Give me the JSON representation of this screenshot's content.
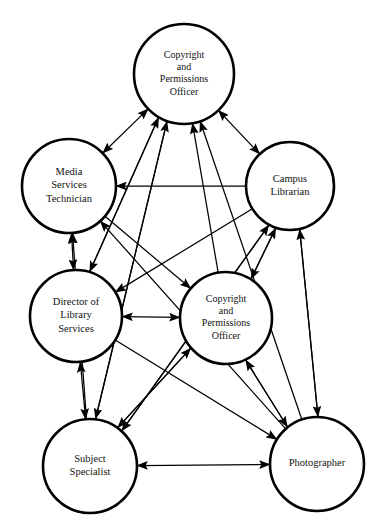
{
  "diagram": {
    "type": "network-sociogram",
    "title": "",
    "background_color": "#ffffff",
    "node_stroke_color": "#000000",
    "edge_color": "#000000",
    "label_color": "#111111",
    "nodes": [
      {
        "id": "copyright_top",
        "label_lines": [
          "Copyright",
          "and",
          "Permissions",
          "Officer"
        ],
        "cx": 184,
        "cy": 74,
        "r": 50
      },
      {
        "id": "media_services",
        "label_lines": [
          "Media",
          "Services",
          "Technician"
        ],
        "cx": 69,
        "cy": 186,
        "r": 47
      },
      {
        "id": "campus_librarian",
        "label_lines": [
          "Campus",
          "Librarian"
        ],
        "cx": 290,
        "cy": 186,
        "r": 44
      },
      {
        "id": "director_library",
        "label_lines": [
          "Director of",
          "Library",
          "Services"
        ],
        "cx": 76,
        "cy": 316,
        "r": 46
      },
      {
        "id": "copyright_center",
        "label_lines": [
          "Copyright",
          "and",
          "Permissions",
          "Officer"
        ],
        "cx": 226,
        "cy": 318,
        "r": 46
      },
      {
        "id": "subject_specialist",
        "label_lines": [
          "Subject",
          "Specialist"
        ],
        "cx": 90,
        "cy": 466,
        "r": 47
      },
      {
        "id": "photographer",
        "label_lines": [
          "Photographer"
        ],
        "cx": 317,
        "cy": 464,
        "r": 47
      }
    ],
    "edges": [
      {
        "from": "media_services",
        "to": "copyright_top",
        "direction": "both"
      },
      {
        "from": "copyright_top",
        "to": "campus_librarian",
        "direction": "both"
      },
      {
        "from": "media_services",
        "to": "director_library",
        "direction": "both"
      },
      {
        "from": "director_library",
        "to": "subject_specialist",
        "direction": "both"
      },
      {
        "from": "subject_specialist",
        "to": "photographer",
        "direction": "both"
      },
      {
        "from": "director_library",
        "to": "copyright_center",
        "direction": "both"
      },
      {
        "from": "campus_librarian",
        "to": "media_services",
        "direction": "forward"
      },
      {
        "from": "campus_librarian",
        "to": "director_library",
        "direction": "forward"
      },
      {
        "from": "campus_librarian",
        "to": "copyright_center",
        "direction": "forward"
      },
      {
        "from": "campus_librarian",
        "to": "subject_specialist",
        "direction": "forward"
      },
      {
        "from": "campus_librarian",
        "to": "photographer",
        "direction": "forward"
      },
      {
        "from": "director_library",
        "to": "copyright_top",
        "direction": "forward"
      },
      {
        "from": "copyright_center",
        "to": "copyright_top",
        "direction": "forward"
      },
      {
        "from": "subject_specialist",
        "to": "copyright_top",
        "direction": "forward"
      },
      {
        "from": "photographer",
        "to": "copyright_top",
        "direction": "forward"
      },
      {
        "from": "subject_specialist",
        "to": "campus_librarian",
        "direction": "forward"
      },
      {
        "from": "photographer",
        "to": "campus_librarian",
        "direction": "forward"
      },
      {
        "from": "copyright_center",
        "to": "campus_librarian",
        "direction": "forward"
      },
      {
        "from": "subject_specialist",
        "to": "copyright_center",
        "direction": "forward"
      },
      {
        "from": "photographer",
        "to": "copyright_center",
        "direction": "forward"
      },
      {
        "from": "copyright_center",
        "to": "subject_specialist",
        "direction": "forward"
      },
      {
        "from": "copyright_center",
        "to": "photographer",
        "direction": "forward"
      },
      {
        "from": "director_library",
        "to": "photographer",
        "direction": "forward"
      },
      {
        "from": "photographer",
        "to": "media_services",
        "direction": "forward"
      },
      {
        "from": "subject_specialist",
        "to": "media_services",
        "direction": "forward"
      },
      {
        "from": "media_services",
        "to": "copyright_center",
        "direction": "forward"
      },
      {
        "from": "copyright_top",
        "to": "subject_specialist",
        "direction": "forward"
      },
      {
        "from": "copyright_top",
        "to": "director_library",
        "direction": "forward"
      }
    ]
  }
}
